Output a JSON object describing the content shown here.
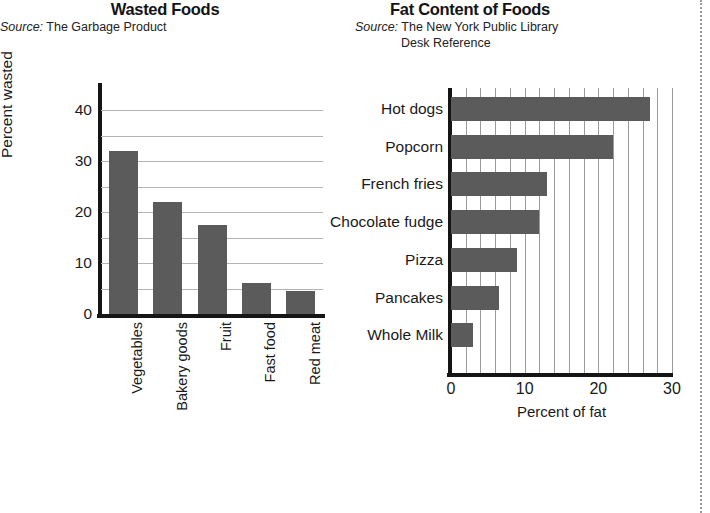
{
  "page": {
    "background": "#ffffff",
    "bar_color": "#5b5b5b",
    "axis_color": "#151515",
    "grid_color": "#b4b4b4"
  },
  "left_chart": {
    "title": "Wasted Foods",
    "source_prefix": "Source:",
    "source_text": "The Garbage Product"
  },
  "right_chart": {
    "title": "Fat Content of Foods",
    "source_prefix": "Source:",
    "source_text_line1": "The New York Public Library",
    "source_text_line2": "Desk Reference"
  },
  "chart_data": [
    {
      "type": "bar",
      "orientation": "vertical",
      "title": "Wasted Foods",
      "categories": [
        "Vegetables",
        "Bakery goods",
        "Fruit",
        "Fast food",
        "Red meat"
      ],
      "values": [
        32,
        22,
        17.5,
        6,
        4.5
      ],
      "xlabel": "",
      "ylabel": "Percent wasted",
      "ylim": [
        0,
        44
      ],
      "yticks": [
        0,
        10,
        20,
        30,
        40
      ],
      "ytick_labels": [
        "0",
        "10",
        "20",
        "30",
        "40"
      ],
      "gridlines_y": [
        5,
        10,
        15,
        20,
        25,
        30,
        35,
        40
      ],
      "grid": true,
      "legend": "none",
      "source": "Source: The Garbage Product"
    },
    {
      "type": "bar",
      "orientation": "horizontal",
      "title": "Fat Content of Foods",
      "categories": [
        "Hot dogs",
        "Popcorn",
        "French fries",
        "Chocolate fudge",
        "Pizza",
        "Pancakes",
        "Whole Milk"
      ],
      "values": [
        27,
        22,
        13,
        12,
        9,
        6.5,
        3
      ],
      "xlabel": "Percent of fat",
      "ylabel": "",
      "xlim": [
        0,
        30
      ],
      "xticks": [
        0,
        10,
        20,
        30
      ],
      "xtick_labels": [
        "0",
        "10",
        "20",
        "30"
      ],
      "gridlines_x": [
        2,
        4,
        6,
        8,
        10,
        12,
        14,
        16,
        18,
        20,
        22,
        24,
        26,
        28,
        30
      ],
      "grid": true,
      "legend": "none",
      "source": "Source: The New York Public Library Desk Reference"
    }
  ]
}
